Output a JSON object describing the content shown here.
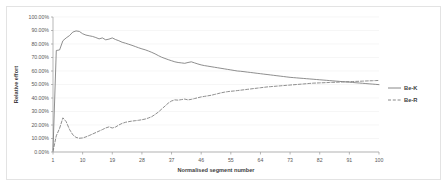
{
  "chart_data": {
    "type": "line",
    "title": "",
    "xlabel": "Normalised segment number",
    "ylabel": "Relative effort",
    "xlim": [
      1,
      100
    ],
    "ylim": [
      0,
      1
    ],
    "grid": true,
    "legend_position": "right",
    "x_tick_labels": [
      "1",
      "10",
      "19",
      "28",
      "37",
      "46",
      "55",
      "64",
      "73",
      "82",
      "91",
      "100"
    ],
    "x_ticks": [
      1,
      10,
      19,
      28,
      37,
      46,
      55,
      64,
      73,
      82,
      91,
      100
    ],
    "y_tick_labels": [
      "0.00%",
      "10.00%",
      "20.00%",
      "30.00%",
      "40.00%",
      "50.00%",
      "60.00%",
      "70.00%",
      "80.00%",
      "90.00%",
      "100.00%"
    ],
    "y_ticks": [
      0,
      0.1,
      0.2,
      0.3,
      0.4,
      0.5,
      0.6,
      0.7,
      0.8,
      0.9,
      1.0
    ],
    "series": [
      {
        "name": "Be-K",
        "style": "solid",
        "color": "#7a7a7a",
        "x": [
          1,
          2,
          3,
          4,
          5,
          6,
          7,
          8,
          9,
          10,
          11,
          12,
          13,
          14,
          15,
          16,
          17,
          18,
          19,
          20,
          21,
          22,
          23,
          24,
          25,
          26,
          27,
          28,
          29,
          30,
          31,
          32,
          33,
          34,
          35,
          36,
          37,
          38,
          39,
          40,
          41,
          42,
          43,
          44,
          45,
          46,
          47,
          48,
          49,
          50,
          51,
          52,
          53,
          54,
          55,
          56,
          57,
          58,
          59,
          60,
          61,
          62,
          63,
          64,
          65,
          66,
          67,
          68,
          69,
          70,
          71,
          72,
          73,
          74,
          75,
          76,
          77,
          78,
          79,
          80,
          81,
          82,
          83,
          84,
          85,
          86,
          87,
          88,
          89,
          90,
          91,
          92,
          93,
          94,
          95,
          96,
          97,
          98,
          99,
          100
        ],
        "values": [
          0.015,
          0.752,
          0.756,
          0.824,
          0.845,
          0.862,
          0.888,
          0.897,
          0.893,
          0.876,
          0.866,
          0.861,
          0.856,
          0.848,
          0.838,
          0.845,
          0.831,
          0.836,
          0.845,
          0.833,
          0.824,
          0.813,
          0.806,
          0.798,
          0.79,
          0.781,
          0.772,
          0.764,
          0.757,
          0.748,
          0.738,
          0.727,
          0.714,
          0.702,
          0.693,
          0.684,
          0.676,
          0.668,
          0.663,
          0.66,
          0.657,
          0.663,
          0.668,
          0.66,
          0.652,
          0.645,
          0.64,
          0.636,
          0.632,
          0.628,
          0.624,
          0.62,
          0.616,
          0.612,
          0.608,
          0.604,
          0.6,
          0.598,
          0.595,
          0.592,
          0.589,
          0.586,
          0.583,
          0.58,
          0.577,
          0.574,
          0.571,
          0.568,
          0.565,
          0.562,
          0.559,
          0.556,
          0.553,
          0.551,
          0.549,
          0.547,
          0.545,
          0.543,
          0.541,
          0.539,
          0.537,
          0.535,
          0.533,
          0.531,
          0.529,
          0.527,
          0.525,
          0.523,
          0.521,
          0.519,
          0.517,
          0.515,
          0.513,
          0.511,
          0.509,
          0.507,
          0.505,
          0.503,
          0.501,
          0.499
        ]
      },
      {
        "name": "Be-R",
        "style": "dashed",
        "color": "#7a7a7a",
        "x": [
          1,
          2,
          3,
          4,
          5,
          6,
          7,
          8,
          9,
          10,
          11,
          12,
          13,
          14,
          15,
          16,
          17,
          18,
          19,
          20,
          21,
          22,
          23,
          24,
          25,
          26,
          27,
          28,
          29,
          30,
          31,
          32,
          33,
          34,
          35,
          36,
          37,
          38,
          39,
          40,
          41,
          42,
          43,
          44,
          45,
          46,
          47,
          48,
          49,
          50,
          51,
          52,
          53,
          54,
          55,
          56,
          57,
          58,
          59,
          60,
          61,
          62,
          63,
          64,
          65,
          66,
          67,
          68,
          69,
          70,
          71,
          72,
          73,
          74,
          75,
          76,
          77,
          78,
          79,
          80,
          81,
          82,
          83,
          84,
          85,
          86,
          87,
          88,
          89,
          90,
          91,
          92,
          93,
          94,
          95,
          96,
          97,
          98,
          99,
          100
        ],
        "values": [
          0.005,
          0.12,
          0.175,
          0.253,
          0.225,
          0.168,
          0.128,
          0.108,
          0.102,
          0.104,
          0.112,
          0.122,
          0.133,
          0.144,
          0.155,
          0.166,
          0.178,
          0.186,
          0.178,
          0.185,
          0.2,
          0.212,
          0.22,
          0.225,
          0.229,
          0.232,
          0.235,
          0.239,
          0.244,
          0.252,
          0.262,
          0.278,
          0.296,
          0.318,
          0.34,
          0.362,
          0.378,
          0.386,
          0.384,
          0.388,
          0.392,
          0.386,
          0.39,
          0.396,
          0.402,
          0.408,
          0.412,
          0.416,
          0.42,
          0.426,
          0.432,
          0.438,
          0.443,
          0.447,
          0.45,
          0.452,
          0.455,
          0.458,
          0.461,
          0.464,
          0.467,
          0.47,
          0.473,
          0.476,
          0.479,
          0.482,
          0.484,
          0.486,
          0.488,
          0.49,
          0.492,
          0.494,
          0.496,
          0.498,
          0.5,
          0.502,
          0.504,
          0.506,
          0.508,
          0.51,
          0.511,
          0.512,
          0.513,
          0.514,
          0.515,
          0.516,
          0.517,
          0.518,
          0.519,
          0.52,
          0.521,
          0.522,
          0.523,
          0.524,
          0.525,
          0.526,
          0.527,
          0.528,
          0.529,
          0.53
        ]
      }
    ]
  },
  "legend": {
    "items": [
      {
        "label": "Be-K",
        "style": "solid"
      },
      {
        "label": "Be-R",
        "style": "dashed"
      }
    ]
  }
}
